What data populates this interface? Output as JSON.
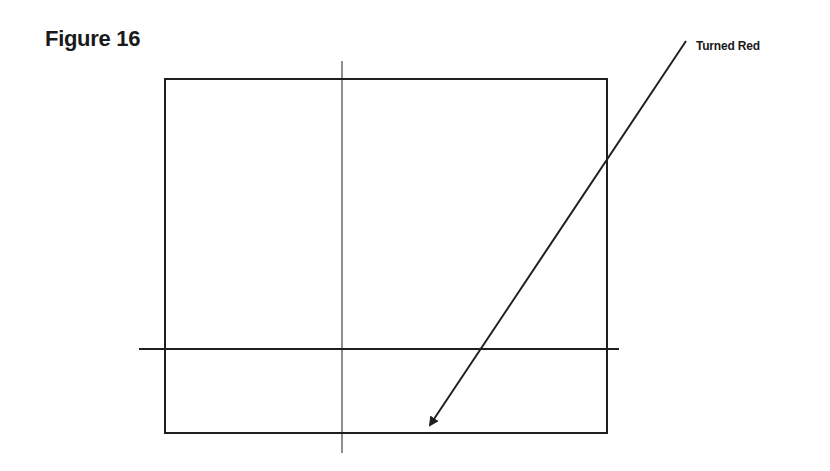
{
  "figure": {
    "title": "Figure 16",
    "annotation_label": "Turned Red"
  },
  "colors": {
    "line": "#1f1f1f",
    "background": "#ffffff"
  }
}
